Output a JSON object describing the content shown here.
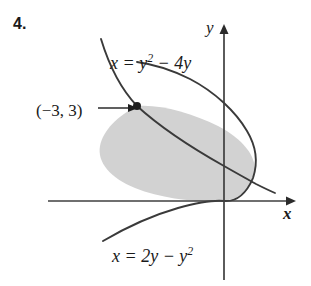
{
  "figure": {
    "problem_number": "4.",
    "axes": {
      "x_label": "x",
      "y_label": "y",
      "origin_px": [
        224,
        201
      ],
      "x_axis_range_px": [
        48,
        290
      ],
      "y_axis_range_px": [
        30,
        282
      ]
    },
    "curves": [
      {
        "name": "upper-curve",
        "label_text": "x = y",
        "label_exponent": "2",
        "label_tail": " − 4y",
        "equation": "x = y^2 - 4y",
        "color": "#3a3a3a"
      },
      {
        "name": "lower-curve",
        "label_text": "x = 2y − y",
        "label_exponent": "2",
        "label_tail": "",
        "equation": "x = 2y - y^2",
        "color": "#3a3a3a"
      }
    ],
    "annotations": [
      {
        "name": "intersection-point",
        "label": "(−3, 3)",
        "point_px": [
          137,
          106
        ],
        "has_arrow": true
      }
    ],
    "shaded_region": {
      "fill_color": "#d2d2d2",
      "stroke_color": "#4a4a4a",
      "description": "region between x = y^2 - 4y and x = 2y - y^2"
    },
    "colors": {
      "ink": "#1a1a1a",
      "curve": "#3a3a3a",
      "axis": "#3f3f3f",
      "shade": "#d2d2d2",
      "background": "#ffffff"
    }
  }
}
